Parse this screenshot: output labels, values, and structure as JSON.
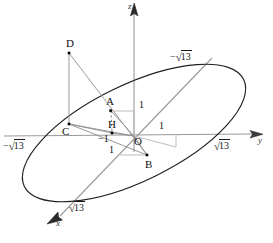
{
  "figure": {
    "type": "3d-coordinate-geometry-diagram",
    "background_color": "#ffffff",
    "colors": {
      "ellipse": "#1a1a1a",
      "axis": "#8a8a8a",
      "construction_line": "#909090",
      "dashed_line": "#777777",
      "point": "#000000",
      "label": "#111111"
    }
  },
  "axes": [
    {
      "name": "z-axis",
      "label": "z",
      "direction": "up"
    },
    {
      "name": "y-axis",
      "label": "y",
      "direction": "right"
    },
    {
      "name": "x-axis",
      "label": "x",
      "direction": "down-left"
    }
  ],
  "points": [
    {
      "name": "A",
      "label": "A",
      "x": 111,
      "y": 111
    },
    {
      "name": "B",
      "label": "B",
      "x": 147,
      "y": 155
    },
    {
      "name": "C",
      "label": "C",
      "x": 69,
      "y": 124
    },
    {
      "name": "D",
      "label": "D",
      "x": 69,
      "y": 53
    },
    {
      "name": "H",
      "label": "H",
      "x": 112,
      "y": 133
    },
    {
      "name": "O",
      "label": "O",
      "x": 134,
      "y": 136
    }
  ],
  "tick_labels": [
    {
      "name": "tick-z-one",
      "text": "1",
      "x": 161,
      "y": 104
    },
    {
      "name": "tick-y-one",
      "text": "1",
      "x": 183,
      "y": 128
    },
    {
      "name": "tick-y-minus-one",
      "text": "−1",
      "x": 102,
      "y": 140
    },
    {
      "name": "tick-x-one",
      "text": "1",
      "x": 111,
      "y": 151
    }
  ],
  "radical_labels": [
    {
      "name": "radical-y-negative",
      "sign": "−",
      "value": "13",
      "x": 6,
      "y": 142
    },
    {
      "name": "radical-y-positive",
      "sign": "",
      "value": "13",
      "x": 214,
      "y": 143
    },
    {
      "name": "radical-x-negative-upper",
      "sign": "−",
      "value": "13",
      "x": 172,
      "y": 56
    },
    {
      "name": "radical-x-positive-lower",
      "sign": "",
      "value": "13",
      "x": 70,
      "y": 206
    }
  ],
  "axis_tip_labels": [
    {
      "name": "axis-label-z",
      "text": "z",
      "x": 132,
      "y": 3
    },
    {
      "name": "axis-label-y",
      "text": "y",
      "x": 258,
      "y": 138
    },
    {
      "name": "axis-label-x",
      "text": "x",
      "x": 55,
      "y": 223
    }
  ],
  "ellipse": {
    "name": "ellipse-curve",
    "center_x": 134,
    "center_y": 133,
    "semi_major": 122,
    "semi_minor": 48,
    "rotation_deg": -26
  },
  "segments": [
    {
      "name": "segment-D-C",
      "from": "D",
      "to": "C"
    },
    {
      "name": "segment-D-B",
      "from": "D",
      "to": "B"
    },
    {
      "name": "segment-C-B",
      "from": "C",
      "to": "B"
    },
    {
      "name": "segment-C-H",
      "from": "C",
      "to": "H"
    },
    {
      "name": "segment-C-O",
      "from": "C",
      "to": "O"
    },
    {
      "name": "segment-A-O",
      "from": "A",
      "to": "O"
    },
    {
      "name": "segment-A-H",
      "from": "A",
      "to": "H",
      "style": "dashed"
    },
    {
      "name": "segment-H-O",
      "from": "H",
      "to": "O"
    },
    {
      "name": "segment-O-B",
      "from": "O",
      "to": "B"
    },
    {
      "name": "segment-A-z-tick",
      "from": "A",
      "to": "z-tick"
    },
    {
      "name": "segment-B-x-tick",
      "from": "B",
      "to": "x-tick"
    }
  ]
}
